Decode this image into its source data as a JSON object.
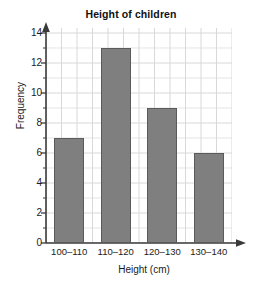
{
  "chart_data": {
    "type": "bar",
    "title": "Height of children",
    "xlabel": "Height (cm)",
    "ylabel": "Frequency",
    "categories": [
      "100–110",
      "110–120",
      "120–130",
      "130–140"
    ],
    "values": [
      7,
      13,
      9,
      6
    ],
    "ylim": [
      0,
      14
    ],
    "ytick_labels": [
      "0",
      "2",
      "4",
      "6",
      "8",
      "10",
      "12",
      "14"
    ],
    "ytick_values": [
      0,
      2,
      4,
      6,
      8,
      10,
      12,
      14
    ],
    "y_minor_step": 1,
    "grid": true,
    "legend": null,
    "bar_color": "#7f7f7f",
    "bar_border_color": "#5a5a5a",
    "grid_color": "#d8d8d8",
    "axis_color": "#3a3a3a",
    "background_color": "#ffffff",
    "axis_arrows": {
      "y_top": true,
      "x_right": true
    }
  }
}
